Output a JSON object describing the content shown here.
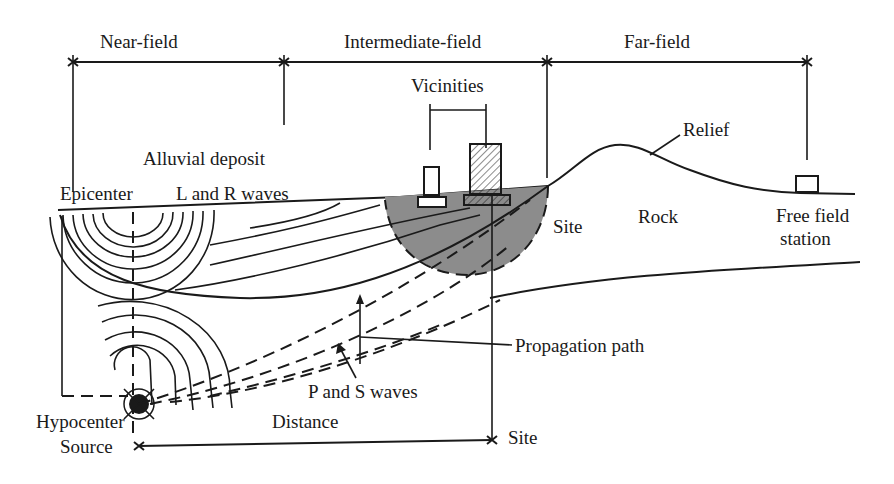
{
  "zones": [
    {
      "label": "Near-field"
    },
    {
      "label": "Intermediate-field"
    },
    {
      "label": "Far-field"
    }
  ],
  "labels": {
    "vicinities": "Vicinities",
    "relief": "Relief",
    "alluvial_deposit": "Alluvial deposit",
    "epicenter": "Epicenter",
    "l_r_waves": "L and R waves",
    "site_upper": "Site",
    "rock": "Rock",
    "free_field_line1": "Free field",
    "free_field_line2": "station",
    "propagation_path": "Propagation path",
    "p_s_waves": "P and S waves",
    "hypocenter": "Hypocenter",
    "source": "Source",
    "distance": "Distance",
    "site_lower": "Site"
  },
  "colors": {
    "ink": "#1a1a1a",
    "site_zone_fill": "#8c8c8c",
    "background": "#ffffff"
  }
}
